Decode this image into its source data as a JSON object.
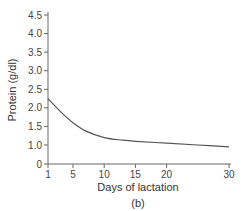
{
  "chart_data": {
    "type": "line",
    "title": "",
    "subtitle": "(b)",
    "xlabel": "Days of lactation",
    "ylabel": "Protein (g/dl)",
    "x_ticks": [
      1,
      5,
      10,
      15,
      20,
      30
    ],
    "x_tick_labels": [
      "1",
      "5",
      "10",
      "15",
      "20",
      "30"
    ],
    "y_ticks": [
      0,
      1.0,
      1.5,
      2.0,
      2.5,
      3.0,
      3.5,
      4.0,
      4.5
    ],
    "y_tick_labels": [
      "0",
      "1.0",
      "1.5",
      "2.0",
      "2.5",
      "3.0",
      "3.5",
      "4.0",
      "4.5"
    ],
    "xlim": [
      1,
      30
    ],
    "ylim": [
      0,
      4.5
    ],
    "grid": false,
    "legend": null,
    "series": [
      {
        "name": "Protein",
        "color": "#555555",
        "x": [
          1,
          3,
          5,
          7,
          10,
          13,
          15,
          20,
          25,
          30
        ],
        "values": [
          2.25,
          1.9,
          1.6,
          1.38,
          1.2,
          1.13,
          1.1,
          1.05,
          1.0,
          0.95
        ]
      }
    ]
  }
}
